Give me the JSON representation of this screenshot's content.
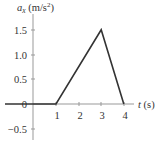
{
  "chart_data": {
    "type": "line",
    "title": "",
    "xlabel": "t (s)",
    "ylabel": "a_x (m/s^2)",
    "ylabel_parts": {
      "symbol": "a",
      "subscript": "x",
      "unit": " (m/s",
      "sup": "2",
      "close": ")"
    },
    "xlabel_parts": {
      "symbol": "t",
      "unit": " (s)"
    },
    "x_ticks": [
      "1",
      "2",
      "3",
      "4"
    ],
    "y_ticks": [
      "1.5",
      "1.0",
      "0.5",
      "0",
      "−0.5"
    ],
    "xlim": [
      -1.5,
      4.8
    ],
    "ylim": [
      -0.65,
      1.8
    ],
    "grid": false,
    "legend": null,
    "series": [
      {
        "name": "a_x",
        "x": [
          -1.5,
          1,
          3,
          4,
          4.8
        ],
        "y": [
          0,
          0,
          1.5,
          0,
          0
        ]
      }
    ]
  },
  "colors": {
    "axis": "#999999",
    "line": "#333333",
    "text": "#333333"
  }
}
